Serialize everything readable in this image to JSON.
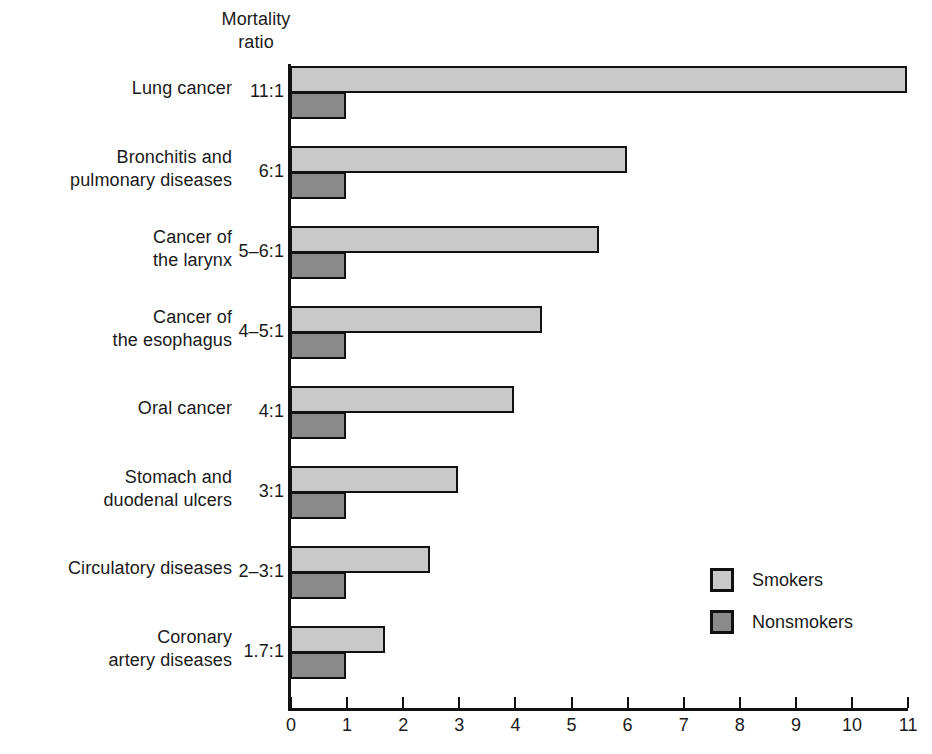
{
  "header": {
    "line1": "Mortality",
    "line2": "ratio"
  },
  "legend": {
    "position": "inside-lower-right",
    "items": [
      {
        "label": "Smokers",
        "color": "#c9c9c9",
        "swatch_name": "legend-swatch-smokers"
      },
      {
        "label": "Nonsmokers",
        "color": "#8a8a8a",
        "swatch_name": "legend-swatch-nonsmokers"
      }
    ]
  },
  "axis": {
    "ticks": [
      "0",
      "1",
      "2",
      "3",
      "4",
      "5",
      "6",
      "7",
      "8",
      "9",
      "10",
      "11"
    ]
  },
  "chart_data": {
    "type": "bar",
    "orientation": "horizontal",
    "title": "",
    "subtitle": "",
    "xlabel": "",
    "ylabel": "Mortality ratio",
    "xlim": [
      0,
      11
    ],
    "grid": false,
    "legend_position": "inside-lower-right",
    "categories": [
      "Lung cancer",
      "Bronchitis and pulmonary diseases",
      "Cancer of the larynx",
      "Cancer of the esophagus",
      "Oral cancer",
      "Stomach and duodenal ulcers",
      "Circulatory diseases",
      "Coronary artery diseases"
    ],
    "ratio_labels": [
      "11:1",
      "6:1",
      "5–6:1",
      "4–5:1",
      "4:1",
      "3:1",
      "2–3:1",
      "1.7:1"
    ],
    "series": [
      {
        "name": "Smokers",
        "color": "#c9c9c9",
        "values": [
          11,
          6,
          5.5,
          4.5,
          4,
          3,
          2.5,
          1.7
        ]
      },
      {
        "name": "Nonsmokers",
        "color": "#8a8a8a",
        "values": [
          1,
          1,
          1,
          1,
          1,
          1,
          1,
          1
        ]
      }
    ]
  },
  "rows": [
    {
      "label_line1": "Lung cancer",
      "label_line2": "",
      "ratio": "11:1",
      "smokers": 11,
      "nonsmokers": 1
    },
    {
      "label_line1": "Bronchitis and",
      "label_line2": "pulmonary diseases",
      "ratio": "6:1",
      "smokers": 6,
      "nonsmokers": 1
    },
    {
      "label_line1": "Cancer of",
      "label_line2": "the larynx",
      "ratio": "5–6:1",
      "smokers": 5.5,
      "nonsmokers": 1
    },
    {
      "label_line1": "Cancer of",
      "label_line2": "the esophagus",
      "ratio": "4–5:1",
      "smokers": 4.5,
      "nonsmokers": 1
    },
    {
      "label_line1": "Oral cancer",
      "label_line2": "",
      "ratio": "4:1",
      "smokers": 4,
      "nonsmokers": 1
    },
    {
      "label_line1": "Stomach and",
      "label_line2": "duodenal ulcers",
      "ratio": "3:1",
      "smokers": 3,
      "nonsmokers": 1
    },
    {
      "label_line1": "Circulatory diseases",
      "label_line2": "",
      "ratio": "2–3:1",
      "smokers": 2.5,
      "nonsmokers": 1
    },
    {
      "label_line1": "Coronary",
      "label_line2": "artery diseases",
      "ratio": "1.7:1",
      "smokers": 1.7,
      "nonsmokers": 1
    }
  ]
}
